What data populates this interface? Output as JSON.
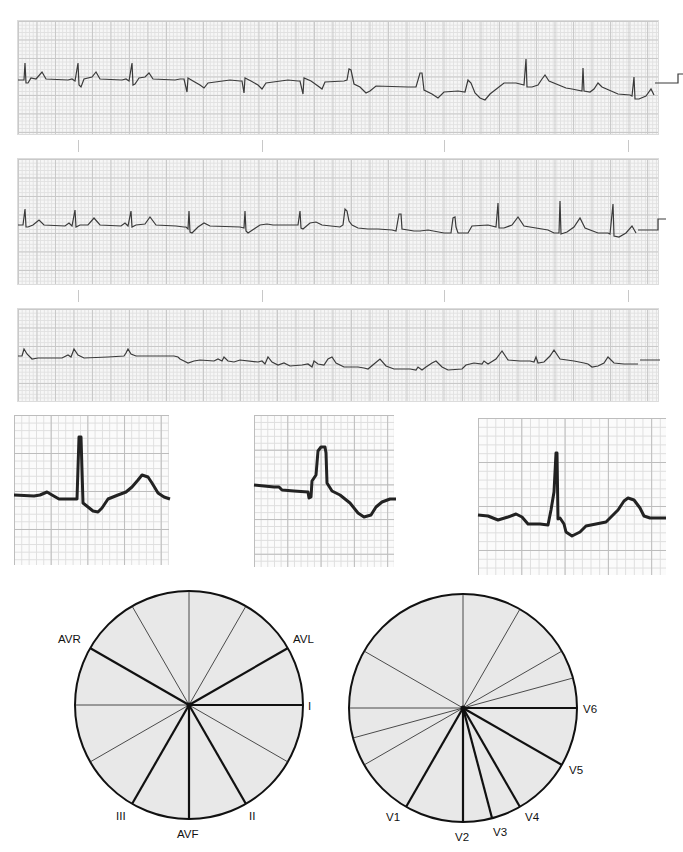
{
  "rhythm_strips": [
    {
      "id": "strip-1",
      "position": "top"
    },
    {
      "id": "strip-2",
      "position": "middle"
    },
    {
      "id": "strip-3",
      "position": "bottom"
    }
  ],
  "detail_insets": [
    {
      "id": "inset-1",
      "description": "QRS complex with ST depression and upright T wave"
    },
    {
      "id": "inset-2",
      "description": "Wide R wave with inverted T wave"
    },
    {
      "id": "inset-3",
      "description": "QRS complex with ST depression and upright T wave"
    }
  ],
  "frontal_axis": {
    "title": "Frontal plane hexaxial reference",
    "labels": {
      "avr": "AVR",
      "avl": "AVL",
      "i": "I",
      "ii": "II",
      "iii": "III",
      "avf": "AVF"
    },
    "bold_leads_deg": {
      "I": 0,
      "AVL": 30,
      "AVR": 150,
      "III": 240,
      "AVF": 270,
      "II": 300
    },
    "thin_lines_deg": [
      60,
      90,
      120,
      180,
      210,
      330
    ]
  },
  "horizontal_axis": {
    "title": "Horizontal plane precordial reference",
    "labels": {
      "v1": "V1",
      "v2": "V2",
      "v3": "V3",
      "v4": "V4",
      "v5": "V5",
      "v6": "V6"
    },
    "bold_leads_deg": {
      "V6": 0,
      "V5": 330,
      "V4": 300,
      "V3": 290,
      "V2": 270,
      "V1": 240
    },
    "thin_lines_deg": [
      15,
      30,
      60,
      90,
      150,
      180,
      195,
      210
    ]
  },
  "colors": {
    "trace": "#3a3a3a",
    "grid_major": "#c9c9c9",
    "grid_minor": "#e1e1e1",
    "circle_fill": "#e8e8e8",
    "line": "#111111"
  }
}
